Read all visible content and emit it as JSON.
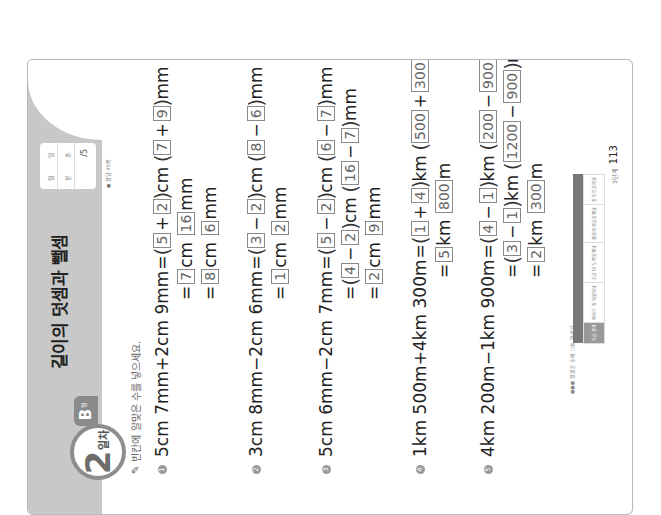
{
  "header": {
    "day_number": "2",
    "day_label": "일차",
    "type_letter": "B",
    "type_suffix": "형",
    "title": "길이의 덧셈과 뺄셈",
    "score_box": {
      "row1": [
        "월",
        "일"
      ],
      "row2": [
        "분",
        "초"
      ],
      "score": "/5"
    },
    "answer_note": "● 정답 45쪽"
  },
  "instruction": "빈칸에 알맞은 수를 넣으세요.",
  "problems": [
    {
      "number": "1",
      "expression": "5cm 7mm+2cm 9mm",
      "lines": [
        [
          "=",
          "(",
          "[5]",
          "+",
          "[2]",
          ")cm ",
          "(",
          "[7]",
          "+",
          "[9]",
          ")mm"
        ],
        [
          "=",
          "[7]",
          "cm ",
          "[16]",
          "mm"
        ],
        [
          "=",
          "[8]",
          "cm ",
          "[6]",
          "mm"
        ]
      ],
      "line1": {
        "a": "5",
        "b": "2",
        "c": "7",
        "d": "9"
      },
      "line2": {
        "a": "7",
        "b": "16"
      },
      "line3": {
        "a": "8",
        "b": "6"
      }
    },
    {
      "number": "2",
      "expression": "3cm 8mm−2cm 6mm",
      "line1": {
        "a": "3",
        "b": "2",
        "c": "8",
        "d": "6"
      },
      "line2": {
        "a": "1",
        "b": "2"
      }
    },
    {
      "number": "3",
      "expression": "5cm 6mm−2cm 7mm",
      "line1": {
        "a": "5",
        "b": "2",
        "c": "6",
        "d": "7"
      },
      "line2": {
        "a": "4",
        "b": "2",
        "c": "16",
        "d": "7"
      },
      "line3": {
        "a": "2",
        "b": "9"
      }
    },
    {
      "number": "4",
      "expression": "1km 500m+4km 300m",
      "line1": {
        "a": "1",
        "b": "4",
        "c": "500",
        "d": "300"
      },
      "line2": {
        "a": "5",
        "b": "800"
      }
    },
    {
      "number": "5",
      "expression": "4km 200m−1km 900m",
      "line1": {
        "a": "4",
        "b": "1",
        "c": "200",
        "d": "900"
      },
      "line2": {
        "a": "3",
        "b": "1",
        "c": "1200",
        "d": "900"
      },
      "line3": {
        "a": "2",
        "b": "300"
      }
    }
  ],
  "symbols": {
    "eq": "=",
    "plus": "+",
    "minus": "−",
    "lparen": "(",
    "rparen": ")",
    "cm": "cm",
    "mm": "mm",
    "km": "km",
    "m": "m"
  },
  "footer": {
    "note": "●●● 알맞은 수에 ○표 하세요.",
    "table_headers": [
      "",
      "",
      "",
      "",
      ""
    ],
    "table_cells": [
      "학습 결과",
      "이해가 잘 되었어요",
      "조금 더 노력할래요",
      "열심히 연습할래요",
      "잘 모르겠어요"
    ],
    "page_label": "3단계",
    "page_number": "113"
  }
}
